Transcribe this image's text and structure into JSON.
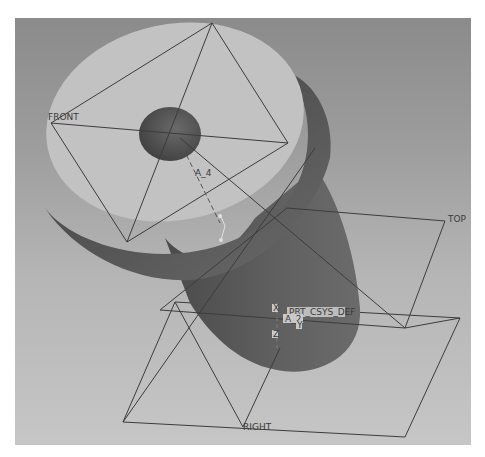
{
  "viewport": {
    "background_top": "#8b8b8b",
    "background_bottom": "#c6c6c6"
  },
  "model": {
    "disc_top_color": "#c2c2c2",
    "disc_side_color": "#5a5a5a",
    "hole_color": "#4e4e4e",
    "boss_color": "#5c5c5c"
  },
  "datum_planes": {
    "front": "FRONT",
    "top": "TOP",
    "right": "RIGHT"
  },
  "datum_axes": {
    "a4": "A_4",
    "a2": "A_2"
  },
  "csys": {
    "name": "PRT_CSYS_DEF",
    "x": "X",
    "y": "Y",
    "z": "Z"
  },
  "line_color": "#3c3c3c"
}
